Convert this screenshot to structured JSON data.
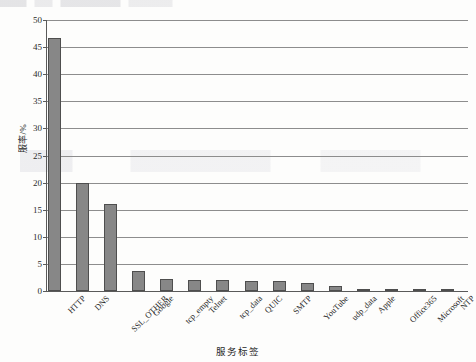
{
  "chart_data": {
    "type": "bar",
    "title": "",
    "xlabel": "服务标签",
    "ylabel": "服率/%",
    "ylim": [
      0,
      50
    ],
    "yticks": [
      0,
      5,
      10,
      15,
      20,
      25,
      30,
      35,
      40,
      45,
      50
    ],
    "grid": true,
    "legend": false,
    "orientation": "vertical",
    "bar_color": "#878787",
    "bar_edge_color": "#4e4e4e",
    "categories": [
      "HTTP",
      "DNS",
      "SSL_OTHER",
      "Google",
      "tcp_empty",
      "Telnet",
      "tcp_data",
      "QUIC",
      "SMTP",
      "YouTube",
      "udp_data",
      "Apple",
      "Office365",
      "Microsoft",
      "NTP"
    ],
    "values": [
      46.7,
      20.0,
      16.0,
      3.7,
      2.2,
      2.1,
      2.0,
      1.9,
      1.8,
      1.4,
      0.9,
      0.4,
      0.15,
      0.35,
      0.3
    ]
  },
  "axis": {
    "y_tick_labels": [
      "50",
      "45",
      "40",
      "35",
      "30",
      "25",
      "20",
      "15",
      "10",
      "5",
      "0"
    ],
    "y_title": "服率/%",
    "x_title": "服务标签"
  }
}
